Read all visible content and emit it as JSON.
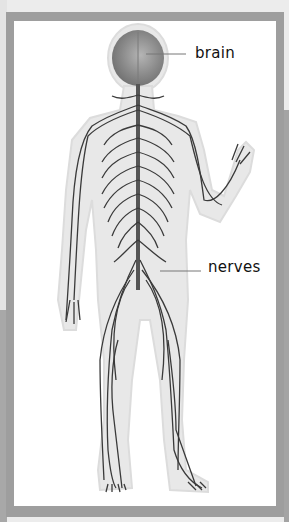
{
  "diagram": {
    "labels": [
      {
        "id": "brain",
        "text": "brain"
      },
      {
        "id": "nerves",
        "text": "nerves"
      }
    ]
  },
  "colors": {
    "frame": "#9e9e9e",
    "background": "#ececec",
    "panel": "#ffffff",
    "body_silhouette": "#e6e6e6",
    "nerve": "#3a3a3a",
    "brain": "#8c8c8c"
  }
}
